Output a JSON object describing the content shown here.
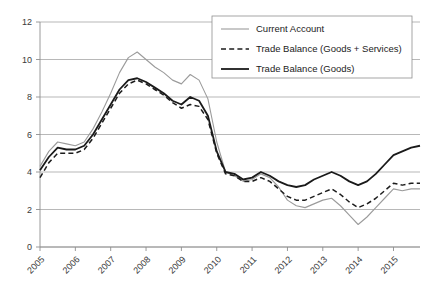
{
  "chart_data": {
    "type": "line",
    "title": "",
    "xlabel": "",
    "ylabel": "",
    "ylim": [
      0,
      12
    ],
    "xlim": [
      2005.0,
      2015.75
    ],
    "yticks": [
      "0",
      "2",
      "4",
      "6",
      "8",
      "10",
      "12"
    ],
    "ytick_values": [
      0,
      2,
      4,
      6,
      8,
      10,
      12
    ],
    "xticks": [
      "2005",
      "2006",
      "2007",
      "2008",
      "2009",
      "2010",
      "2011",
      "2012",
      "2013",
      "2014",
      "2015"
    ],
    "xtick_values": [
      2005,
      2006,
      2007,
      2008,
      2009,
      2010,
      2011,
      2012,
      2013,
      2014,
      2015
    ],
    "grid": "horizontal",
    "legend_position": "top-right",
    "x": [
      2005.0,
      2005.25,
      2005.5,
      2005.75,
      2006.0,
      2006.25,
      2006.5,
      2006.75,
      2007.0,
      2007.25,
      2007.5,
      2007.75,
      2008.0,
      2008.25,
      2008.5,
      2008.75,
      2009.0,
      2009.25,
      2009.5,
      2009.75,
      2010.0,
      2010.25,
      2010.5,
      2010.75,
      2011.0,
      2011.25,
      2011.5,
      2011.75,
      2012.0,
      2012.25,
      2012.5,
      2012.75,
      2013.0,
      2013.25,
      2013.5,
      2013.75,
      2014.0,
      2014.25,
      2014.5,
      2014.75,
      2015.0,
      2015.25,
      2015.5,
      2015.75
    ],
    "series": [
      {
        "name": "Current Account",
        "color": "#9b9b9b",
        "style": "solid",
        "width": 1.1,
        "values": [
          4.3,
          5.1,
          5.6,
          5.5,
          5.4,
          5.6,
          6.3,
          7.2,
          8.2,
          9.3,
          10.1,
          10.4,
          10.0,
          9.6,
          9.3,
          8.9,
          8.7,
          9.2,
          8.9,
          7.9,
          5.6,
          4.0,
          3.8,
          3.5,
          3.6,
          3.9,
          3.7,
          3.2,
          2.5,
          2.2,
          2.1,
          2.3,
          2.5,
          2.6,
          2.2,
          1.7,
          1.2,
          1.6,
          2.1,
          2.6,
          3.1,
          3.0,
          3.1,
          3.1
        ]
      },
      {
        "name": "Trade Balance (Goods + Services)",
        "color": "#1c1c1c",
        "style": "dashed",
        "width": 1.5,
        "values": [
          3.7,
          4.5,
          5.0,
          5.0,
          5.0,
          5.2,
          5.8,
          6.6,
          7.4,
          8.2,
          8.7,
          8.9,
          8.7,
          8.4,
          8.1,
          7.7,
          7.4,
          7.6,
          7.5,
          6.8,
          5.0,
          3.9,
          3.8,
          3.5,
          3.5,
          3.7,
          3.5,
          3.1,
          2.7,
          2.5,
          2.5,
          2.7,
          2.9,
          3.1,
          2.8,
          2.4,
          2.1,
          2.3,
          2.6,
          3.0,
          3.4,
          3.3,
          3.4,
          3.4
        ]
      },
      {
        "name": "Trade Balance (Goods)",
        "color": "#1a1a1a",
        "style": "solid",
        "width": 1.8,
        "values": [
          4.1,
          4.8,
          5.3,
          5.2,
          5.2,
          5.4,
          6.0,
          6.8,
          7.6,
          8.4,
          8.9,
          9.0,
          8.8,
          8.5,
          8.2,
          7.8,
          7.6,
          8.0,
          7.8,
          7.0,
          5.1,
          4.0,
          3.9,
          3.6,
          3.7,
          4.0,
          3.8,
          3.5,
          3.3,
          3.2,
          3.3,
          3.6,
          3.8,
          4.0,
          3.8,
          3.5,
          3.3,
          3.5,
          3.9,
          4.4,
          4.9,
          5.1,
          5.3,
          5.4
        ]
      }
    ]
  },
  "legend": {
    "items": [
      {
        "label": "Current Account"
      },
      {
        "label": "Trade Balance (Goods + Services)"
      },
      {
        "label": "Trade Balance (Goods)"
      }
    ]
  }
}
